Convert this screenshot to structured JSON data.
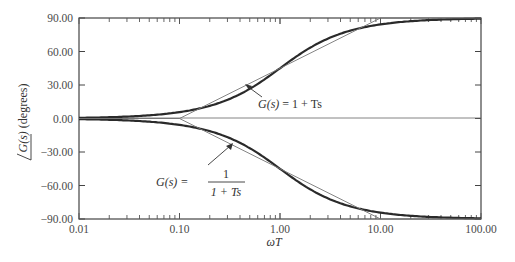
{
  "chart_data": {
    "type": "line",
    "title": "",
    "xlabel": "ωT",
    "ylabel": "∠G(s) (degrees)",
    "xscale": "log",
    "xlim": [
      0.01,
      100
    ],
    "ylim": [
      -90,
      90
    ],
    "x_ticks": [
      "0.01",
      "0.10",
      "1.00",
      "10.00",
      "100.00"
    ],
    "y_ticks": [
      "90.00",
      "60.00",
      "30.00",
      "0.00",
      "-30.00",
      "-60.00",
      "-90.00"
    ],
    "grid": false,
    "series": [
      {
        "name": "G(s) = 1 + Ts (exact)",
        "style": "thick",
        "x": [
          0.01,
          0.02,
          0.05,
          0.1,
          0.2,
          0.5,
          1,
          2,
          5,
          10,
          20,
          50,
          100
        ],
        "values": [
          0.57,
          1.15,
          2.86,
          5.71,
          11.31,
          26.57,
          45.0,
          63.43,
          78.69,
          84.29,
          87.14,
          88.85,
          89.43
        ]
      },
      {
        "name": "G(s) = 1 + Ts (asymptote)",
        "style": "thin",
        "x": [
          0.01,
          0.1,
          1,
          10,
          100
        ],
        "values": [
          0,
          0,
          45,
          90,
          90
        ]
      },
      {
        "name": "G(s) = 1/(1 + Ts) (exact)",
        "style": "thick",
        "x": [
          0.01,
          0.02,
          0.05,
          0.1,
          0.2,
          0.5,
          1,
          2,
          5,
          10,
          20,
          50,
          100
        ],
        "values": [
          -0.57,
          -1.15,
          -2.86,
          -5.71,
          -11.31,
          -26.57,
          -45.0,
          -63.43,
          -78.69,
          -84.29,
          -87.14,
          -88.85,
          -89.43
        ]
      },
      {
        "name": "G(s) = 1/(1 + Ts) (asymptote)",
        "style": "thin",
        "x": [
          0.01,
          0.1,
          1,
          10,
          100
        ],
        "values": [
          0,
          0,
          -45,
          -90,
          -90
        ]
      }
    ],
    "annotations": [
      {
        "text": "G(s) = 1 + Ts",
        "target": "upper curve"
      },
      {
        "text": "G(s) = 1 / (1 + Ts)",
        "target": "lower curve"
      }
    ]
  },
  "labels": {
    "xlabel": "ωT",
    "ylabel_angle": "G(s)",
    "ylabel_unit": " (degrees)",
    "upper_annot_lhs": "G(s)",
    "upper_annot_rhs": " = 1 + Ts",
    "lower_annot_lhs": "G(s) =",
    "lower_annot_num": "1",
    "lower_annot_den": "1 + Ts"
  }
}
